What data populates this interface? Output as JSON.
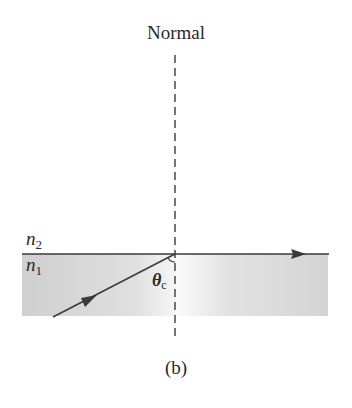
{
  "diagram": {
    "normal_label": "Normal",
    "caption": "(b)",
    "upper_medium": {
      "symbol": "n",
      "subscript": "2"
    },
    "lower_medium": {
      "symbol": "n",
      "subscript": "1"
    },
    "angle_label": {
      "symbol": "θ",
      "subscript": "c"
    },
    "colors": {
      "line": "#3a3a3a",
      "shaded_medium": "#d6d6d6",
      "shaded_medium_light": "#f2f2f2",
      "text": "#2a2a2a"
    }
  }
}
